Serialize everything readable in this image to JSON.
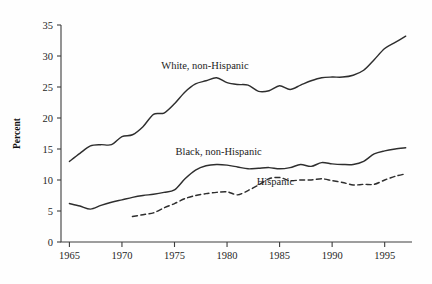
{
  "chart_data": {
    "type": "line",
    "title": "",
    "xlabel": "",
    "ylabel": "Percent",
    "xlim": [
      1964.2,
      1997.6
    ],
    "ylim": [
      0,
      35
    ],
    "grid": false,
    "legend_position": "inline-annotations",
    "xticks": [
      1965,
      1970,
      1975,
      1980,
      1985,
      1990,
      1995
    ],
    "xtick_labels": [
      "1965",
      "1970",
      "1975",
      "1980",
      "1985",
      "1990",
      "1995"
    ],
    "yticks": [
      0,
      5,
      10,
      15,
      20,
      25,
      30,
      35
    ],
    "ytick_labels": [
      "0",
      "5",
      "10",
      "15",
      "20",
      "25",
      "30",
      "35"
    ],
    "series": [
      {
        "name": "White, non-Hispanic",
        "style": "solid",
        "color": "#2e2e2e",
        "annotation": "White, non-Hispanic",
        "annotation_x": 1977.9,
        "annotation_y": 27.9,
        "x": [
          1965,
          1966,
          1967,
          1968,
          1969,
          1970,
          1971,
          1972,
          1973,
          1974,
          1975,
          1976,
          1977,
          1978,
          1979,
          1980,
          1981,
          1982,
          1983,
          1984,
          1985,
          1986,
          1987,
          1988,
          1989,
          1990,
          1991,
          1992,
          1993,
          1994,
          1995,
          1996,
          1997
        ],
        "values": [
          13.0,
          14.3,
          15.5,
          15.7,
          15.7,
          17.0,
          17.3,
          18.6,
          20.6,
          20.8,
          22.3,
          24.2,
          25.5,
          26.0,
          26.5,
          25.7,
          25.4,
          25.3,
          24.3,
          24.4,
          25.2,
          24.6,
          25.3,
          26.0,
          26.5,
          26.6,
          26.6,
          26.9,
          27.7,
          29.4,
          31.2,
          32.2,
          33.2
        ]
      },
      {
        "name": "Black, non-Hispanic",
        "style": "solid",
        "color": "#2e2e2e",
        "annotation": "Black, non-Hispanic",
        "annotation_x": 1979.2,
        "annotation_y": 14.0,
        "x": [
          1965,
          1966,
          1967,
          1968,
          1969,
          1970,
          1971,
          1972,
          1973,
          1974,
          1975,
          1976,
          1977,
          1978,
          1979,
          1980,
          1981,
          1982,
          1983,
          1984,
          1985,
          1986,
          1987,
          1988,
          1989,
          1990,
          1991,
          1992,
          1993,
          1994,
          1995,
          1996,
          1997
        ],
        "values": [
          6.2,
          5.8,
          5.3,
          5.9,
          6.4,
          6.8,
          7.2,
          7.5,
          7.7,
          8.0,
          8.4,
          10.2,
          11.6,
          12.3,
          12.5,
          12.4,
          12.1,
          11.8,
          11.9,
          12.0,
          11.8,
          12.0,
          12.5,
          12.2,
          12.8,
          12.6,
          12.5,
          12.5,
          13.0,
          14.2,
          14.7,
          15.0,
          15.2
        ]
      },
      {
        "name": "Hispanic",
        "style": "dashed",
        "color": "#2e2e2e",
        "annotation": "Hispanic",
        "annotation_x": 1984.6,
        "annotation_y": 9.2,
        "x": [
          1971,
          1972,
          1973,
          1974,
          1975,
          1976,
          1977,
          1978,
          1979,
          1980,
          1981,
          1982,
          1983,
          1984,
          1985,
          1986,
          1987,
          1988,
          1989,
          1990,
          1991,
          1992,
          1993,
          1994,
          1995,
          1996,
          1997
        ],
        "values": [
          4.1,
          4.4,
          4.7,
          5.5,
          6.2,
          7.0,
          7.5,
          7.8,
          8.0,
          8.1,
          7.6,
          8.3,
          9.2,
          10.2,
          10.4,
          9.9,
          10.0,
          10.0,
          10.2,
          9.9,
          9.6,
          9.2,
          9.3,
          9.3,
          10.0,
          10.6,
          11.0
        ]
      }
    ]
  }
}
